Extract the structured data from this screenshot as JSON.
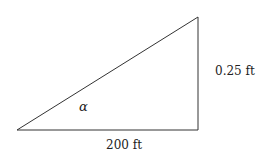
{
  "diagram": {
    "type": "right-triangle",
    "vertices": {
      "bottom_left": [
        17,
        130
      ],
      "bottom_right": [
        198,
        130
      ],
      "top_right": [
        198,
        17
      ]
    },
    "stroke_color": "#333333",
    "labels": {
      "base": "200 ft",
      "height": "0.25 ft",
      "angle": "α"
    }
  }
}
